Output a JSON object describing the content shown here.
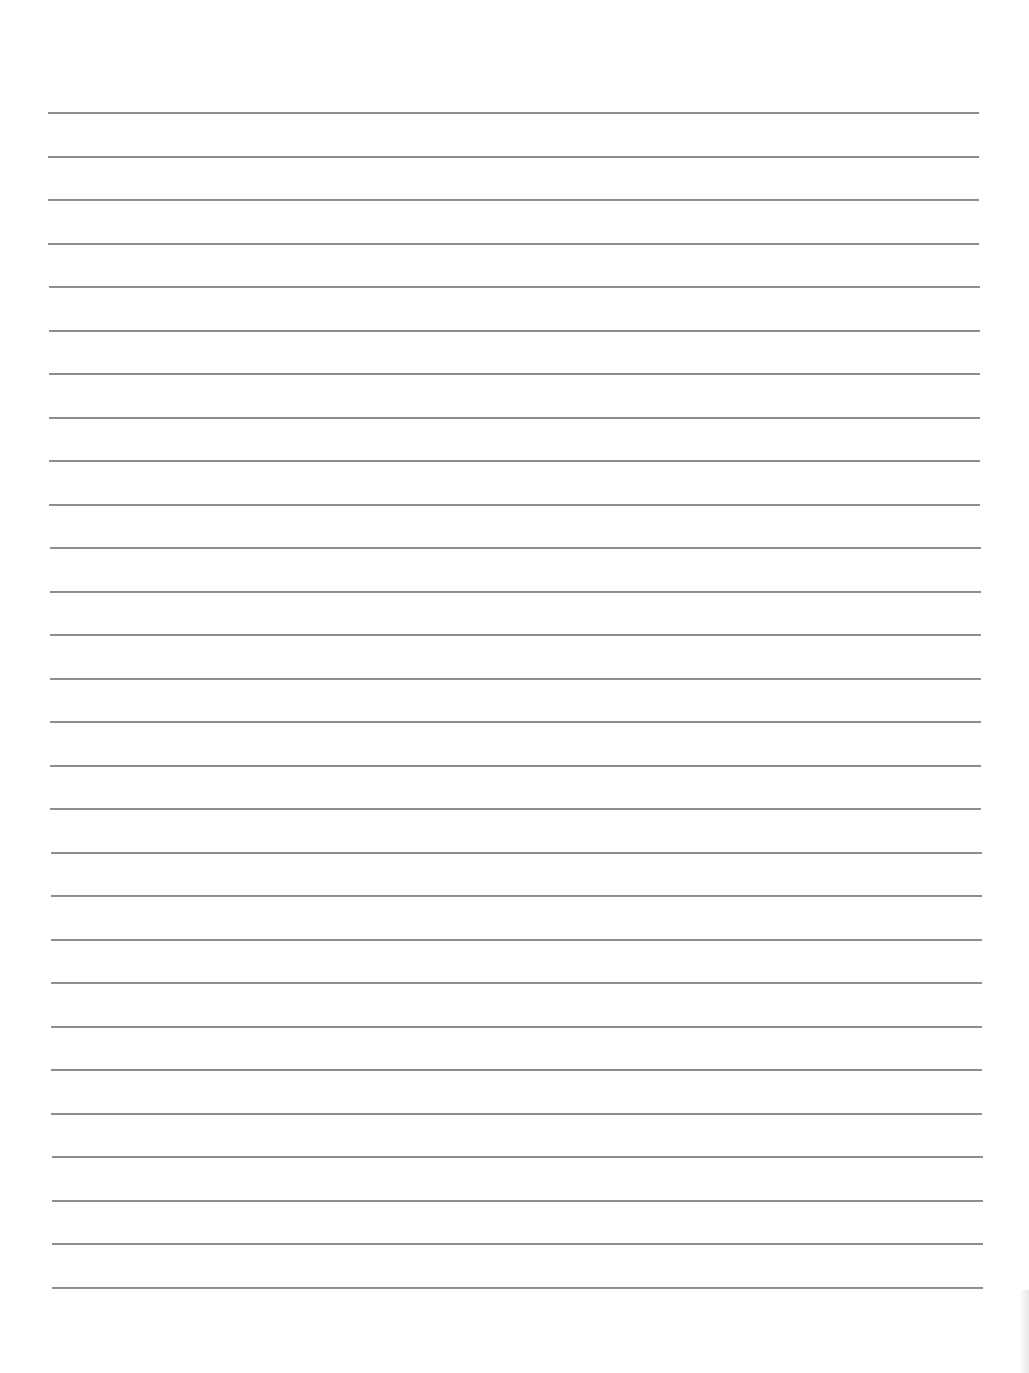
{
  "document": {
    "type": "lined-paper",
    "background_color": "#ffffff",
    "rule_color": "#8c8c8c",
    "rule_count": 28,
    "rule_left_px": 48,
    "rule_right_px": 979,
    "first_rule_y_px": 112,
    "rule_spacing_px": 43.5,
    "text": ""
  }
}
